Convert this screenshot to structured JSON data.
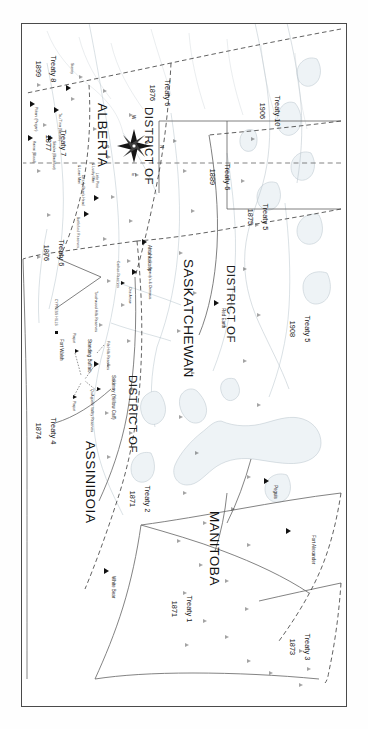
{
  "document": {
    "type": "historical-map",
    "title": "Numbered Treaties of the Canadian North-West Territories",
    "orientation": "landscape map displayed rotated 90 degrees in a portrait frame"
  },
  "provinces": [
    {
      "name": "MANITOBA"
    },
    {
      "name": "SASKATCHEWAN"
    },
    {
      "name": "ALBERTA"
    },
    {
      "name": "ASSINIBOIA"
    }
  ],
  "districts": [
    {
      "label": "DISTRICT OF",
      "of": "SASKATCHEWAN"
    },
    {
      "label": "DISTRICT OF",
      "of": "ASSINIBOIA"
    },
    {
      "label": "DISTRICT OF",
      "of": "ALBERTA"
    }
  ],
  "treaties": [
    {
      "name": "Treaty 1",
      "year": "1871"
    },
    {
      "name": "Treaty 2",
      "year": "1871"
    },
    {
      "name": "Treaty 3",
      "year": "1873"
    },
    {
      "name": "Treaty 4",
      "year": "1874"
    },
    {
      "name": "Treaty 5",
      "year": "1875"
    },
    {
      "name": "Treaty 5",
      "year": "1908"
    },
    {
      "name": "Treaty 6",
      "year": "1876"
    },
    {
      "name": "Treaty 6",
      "year": "1889"
    },
    {
      "name": "Treaty 6",
      "year": "1876"
    },
    {
      "name": "Treaty 7",
      "year": "1877"
    },
    {
      "name": "Treaty 8",
      "year": "1899"
    },
    {
      "name": "Treaty 10",
      "year": "1906"
    }
  ],
  "places": [
    {
      "name": "Fort Alexander",
      "marker": "triangle"
    },
    {
      "name": "Peguis",
      "marker": "triangle"
    },
    {
      "name": "White Bear",
      "marker": "triangle"
    },
    {
      "name": "Red Earth",
      "marker": "triangle"
    },
    {
      "name": "Fort Walsh",
      "marker": "square"
    }
  ],
  "reserves": [
    {
      "name": "Touchwood Hills Reserves"
    },
    {
      "name": "File Hills Reserves"
    },
    {
      "name": "Standing Buffalo"
    },
    {
      "name": "Sakimay (Yellow Calf)"
    },
    {
      "name": "Qu'Appelle Valley Reserves"
    },
    {
      "name": "Piapot"
    },
    {
      "name": "Piapot"
    },
    {
      "name": "Ahtahkakoop"
    },
    {
      "name": "Beardy's & Okimasis"
    },
    {
      "name": "One Arrow"
    },
    {
      "name": "Carlton Reserves"
    },
    {
      "name": "Battleford Reserves"
    },
    {
      "name": "Little Pine\n& Lucky Man"
    },
    {
      "name": "Grizzly Bear's Head\n& Lean Man"
    },
    {
      "name": "Stoney"
    },
    {
      "name": "Tsu T'ina (Sarcee)"
    },
    {
      "name": "Siksika (Blackfoot)"
    },
    {
      "name": "Piikani (Peigan)"
    },
    {
      "name": "Kainai (Blood)"
    }
  ],
  "physical_features": [
    {
      "name": "CYPRESS HILLS"
    }
  ],
  "compass": {
    "north": "N",
    "east": "E",
    "south": "S",
    "west": "W"
  },
  "colors": {
    "frame": "#4a4a4a",
    "land": "#ffffff",
    "water": "#e8eef2",
    "boundary_solid": "#5f5f5f",
    "boundary_dashed": "#333333",
    "text": "#1b1b1b",
    "marker": "#111111"
  }
}
